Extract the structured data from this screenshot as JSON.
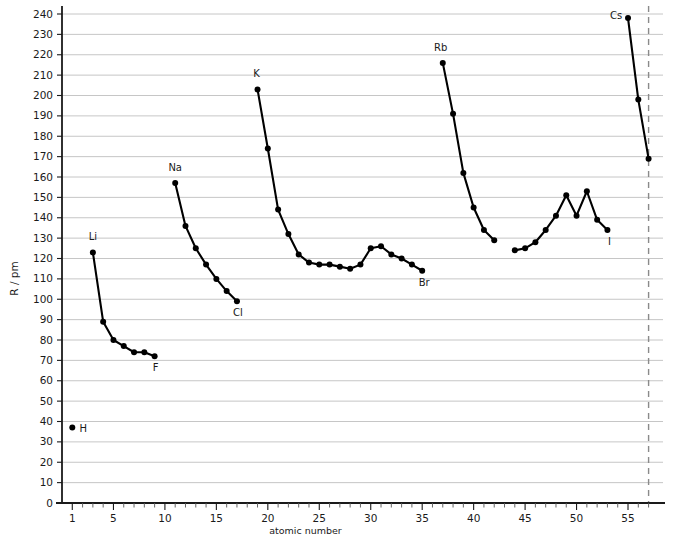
{
  "chart_data": {
    "type": "line",
    "title": "",
    "xlabel": "atomic number",
    "ylabel": "R / pm",
    "xlim": [
      0,
      57
    ],
    "ylim": [
      0,
      240
    ],
    "grid": true,
    "legend": false,
    "y_ticks": [
      0,
      10,
      20,
      30,
      40,
      50,
      60,
      70,
      80,
      90,
      100,
      110,
      120,
      130,
      140,
      150,
      160,
      170,
      180,
      190,
      200,
      210,
      220,
      230,
      240
    ],
    "x_ticks_labeled": [
      1,
      5,
      10,
      15,
      20,
      25,
      30,
      35,
      40,
      45,
      50,
      55
    ],
    "x_tick_min": 1,
    "x_tick_max": 57,
    "series": [
      {
        "name": "period-1",
        "x": [
          1
        ],
        "values": [
          37
        ],
        "connected": false
      },
      {
        "name": "period-2",
        "x": [
          3,
          4,
          5,
          6,
          7,
          8,
          9
        ],
        "values": [
          123,
          89,
          80,
          77,
          74,
          74,
          72
        ],
        "connected": true
      },
      {
        "name": "period-3",
        "x": [
          11,
          12,
          13,
          14,
          15,
          16,
          17
        ],
        "values": [
          157,
          136,
          125,
          117,
          110,
          104,
          99
        ],
        "connected": true
      },
      {
        "name": "period-4",
        "x": [
          19,
          20,
          21,
          22,
          23,
          24,
          25,
          26,
          27,
          28,
          29,
          30,
          31,
          32,
          33,
          34,
          35
        ],
        "values": [
          203,
          174,
          144,
          132,
          122,
          118,
          117,
          117,
          116,
          115,
          117,
          125,
          126,
          122,
          120,
          117,
          114
        ],
        "connected": true
      },
      {
        "name": "period-5a",
        "x": [
          37,
          38,
          39,
          40,
          41,
          42
        ],
        "values": [
          216,
          191,
          162,
          145,
          134,
          129
        ],
        "connected": true
      },
      {
        "name": "period-5b",
        "x": [
          44,
          45,
          46,
          47,
          48,
          49,
          50,
          51,
          52,
          53
        ],
        "values": [
          124,
          125,
          128,
          134,
          141,
          151,
          141,
          153,
          139,
          134
        ],
        "connected": true
      },
      {
        "name": "period-6",
        "x": [
          55,
          56,
          57
        ],
        "values": [
          238,
          198,
          169
        ],
        "connected": true
      }
    ],
    "annotations": [
      {
        "text": "H",
        "x": 1,
        "y": 37,
        "dx": 11,
        "dy": 4
      },
      {
        "text": "Li",
        "x": 3,
        "y": 123,
        "dx": 0,
        "dy": -12
      },
      {
        "text": "F",
        "x": 9,
        "y": 72,
        "dx": 1,
        "dy": 15
      },
      {
        "text": "Na",
        "x": 11,
        "y": 157,
        "dx": 0,
        "dy": -12
      },
      {
        "text": "Cl",
        "x": 17,
        "y": 99,
        "dx": 1,
        "dy": 15
      },
      {
        "text": "K",
        "x": 19,
        "y": 203,
        "dx": -1,
        "dy": -12
      },
      {
        "text": "Br",
        "x": 35,
        "y": 114,
        "dx": 2,
        "dy": 15
      },
      {
        "text": "Rb",
        "x": 37,
        "y": 216,
        "dx": -2,
        "dy": -12
      },
      {
        "text": "I",
        "x": 53,
        "y": 134,
        "dx": 2,
        "dy": 15
      },
      {
        "text": "Cs",
        "x": 55,
        "y": 238,
        "dx": -12,
        "dy": 1
      }
    ],
    "boundary_line": {
      "x": 57,
      "style": "dashed"
    },
    "colors": {
      "line": "#000000",
      "point": "#000000",
      "grid": "#b8b8b8",
      "axis": "#1a1a1a",
      "boundary": "#8a8a8a",
      "background": "#ffffff"
    }
  }
}
